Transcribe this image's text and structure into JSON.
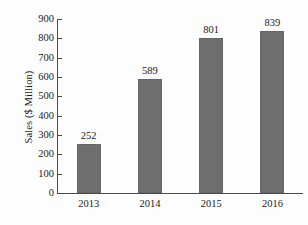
{
  "chart_data": {
    "type": "bar",
    "title": "",
    "subtitle": "",
    "xlabel": "",
    "ylabel": "Sales ($ Million)",
    "categories": [
      "2013",
      "2014",
      "2015",
      "2016"
    ],
    "values": [
      252,
      589,
      801,
      839
    ],
    "value_labels": [
      "252",
      "589",
      "801",
      "839"
    ],
    "series": [
      {
        "name": "Sales",
        "values": [
          252,
          589,
          801,
          839
        ],
        "color": "#6e6e6e"
      }
    ],
    "ylim": [
      0,
      900
    ],
    "ytick_step": 100,
    "ytick_labels": [
      "900",
      "800",
      "700",
      "600",
      "500",
      "400",
      "300",
      "200",
      "100",
      "0"
    ],
    "ytick_values": [
      900,
      800,
      700,
      600,
      500,
      400,
      300,
      200,
      100,
      0
    ],
    "xtick_labels": [
      "2013",
      "2014",
      "2015",
      "2016"
    ],
    "grid": false,
    "legend": false,
    "legend_position": "none",
    "annotations": [],
    "colors": {
      "bar_fill": "#6e6e6e",
      "bar_edge": "#666666",
      "axis": "#4a4a4a",
      "text": "#1a1a1a",
      "background": "#fdfdfd"
    }
  }
}
